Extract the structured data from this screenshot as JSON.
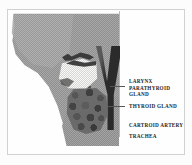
{
  "figure": {
    "kind": "anatomical-illustration",
    "rendering": "scanned halftone black-and-white line drawing"
  },
  "labels": [
    {
      "id": "larynx",
      "text": "LARYNX",
      "has_leader": false
    },
    {
      "id": "parathyroid",
      "text": "PARATHYROID\nGLAND",
      "has_leader": true
    },
    {
      "id": "thyroid",
      "text": "THYROID  GLAND",
      "has_leader": true
    },
    {
      "id": "carotid",
      "text": "CARTROID  ARTERY",
      "has_leader": false
    },
    {
      "id": "trachea",
      "text": "TRACHEA",
      "has_leader": false
    }
  ],
  "regions": [
    {
      "id": "head-silhouette",
      "name": "head-and-neck-silhouette"
    },
    {
      "id": "larynx-shape",
      "name": "larynx-cartilage"
    },
    {
      "id": "thyroid-shape",
      "name": "thyroid-gland-mass"
    },
    {
      "id": "carotid-shape",
      "name": "carotid-artery-vessel"
    },
    {
      "id": "trachea-shape",
      "name": "trachea-tube"
    }
  ],
  "colors": {
    "paper": "#fcfcfc",
    "frame": "#8d8d8d",
    "silhouette_gray": "#9a9a9a",
    "vessel_dark": "#2b2b2b",
    "gland_dark": "#6a6a6a",
    "label_text": "#1e1e1e",
    "leader_line": "#565656"
  }
}
